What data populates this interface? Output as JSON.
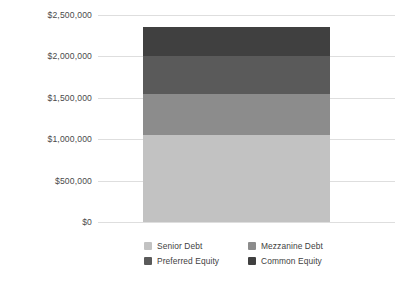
{
  "chart_data": {
    "type": "bar",
    "subtype": "stacked-bar",
    "title": "",
    "xlabel": "",
    "ylabel": "",
    "categories": [
      "Capital Stack"
    ],
    "series": [
      {
        "name": "Senior Debt",
        "values": [
          1050000
        ],
        "color": "#c2c2c2"
      },
      {
        "name": "Mezzanine Debt",
        "values": [
          500000
        ],
        "color": "#8c8c8c"
      },
      {
        "name": "Preferred Equity",
        "values": [
          450000
        ],
        "color": "#5a5a5a"
      },
      {
        "name": "Common Equity",
        "values": [
          350000
        ],
        "color": "#404040"
      }
    ],
    "total": 2350000,
    "ylim": [
      0,
      2500000
    ],
    "ytick_values": [
      0,
      500000,
      1000000,
      1500000,
      2000000,
      2500000
    ],
    "ytick_labels": [
      "$0",
      "$500,000",
      "$1,000,000",
      "$1,500,000",
      "$2,000,000",
      "$2,500,000"
    ],
    "grid": true,
    "grid_color": "#dedede",
    "legend_position": "bottom",
    "background": "#ffffff",
    "text_color": "#4a4a4a"
  },
  "axis": {
    "ticks": [
      {
        "label": "$2,500,000",
        "value": 2500000
      },
      {
        "label": "$2,000,000",
        "value": 2000000
      },
      {
        "label": "$1,500,000",
        "value": 1500000
      },
      {
        "label": "$1,000,000",
        "value": 1000000
      },
      {
        "label": "$500,000",
        "value": 500000
      },
      {
        "label": "$0",
        "value": 0
      }
    ]
  },
  "legend": {
    "items": [
      {
        "label": "Senior Debt",
        "color": "#c2c2c2"
      },
      {
        "label": "Mezzanine Debt",
        "color": "#8c8c8c"
      },
      {
        "label": "Preferred Equity",
        "color": "#5a5a5a"
      },
      {
        "label": "Common Equity",
        "color": "#404040"
      }
    ]
  }
}
